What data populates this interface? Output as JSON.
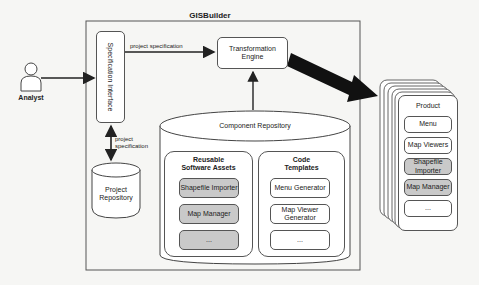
{
  "title": "GISBuilder",
  "actor": {
    "label": "Analyst"
  },
  "spec_interface": {
    "label": "Specification Interface"
  },
  "edges": {
    "analyst_to_spec": "",
    "spec_to_engine": "project specification",
    "spec_to_repo_line1": "project",
    "spec_to_repo_line2": "specification"
  },
  "transformation_engine": {
    "line1": "Transformation",
    "line2": "Engine"
  },
  "project_repository": {
    "line1": "Project",
    "line2": "Repository"
  },
  "component_repository": {
    "label": "Component Repository",
    "reusable_assets": {
      "title_line1": "Reusable",
      "title_line2": "Software Assets",
      "items": [
        "Shapefile Importer",
        "Map Manager",
        "..."
      ]
    },
    "code_templates": {
      "title_line1": "Code",
      "title_line2": "Templates",
      "items": [
        "Menu Generator",
        "Map Viewer Generator",
        "..."
      ]
    }
  },
  "product": {
    "title": "Product",
    "items": [
      "Menu",
      "Map Viewers",
      "Shapefile Importer",
      "Map Manager",
      "..."
    ]
  },
  "colors": {
    "line": "#555555",
    "reusable_fill": "#c9c9c9",
    "arrow": "#111111"
  }
}
